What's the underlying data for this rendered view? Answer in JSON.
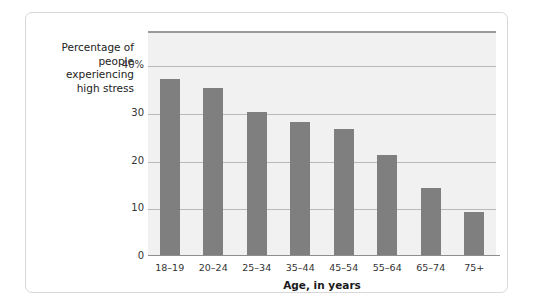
{
  "chart_data": {
    "type": "bar",
    "title": "",
    "subtitle": "",
    "categories": [
      "18–19",
      "20–24",
      "25–34",
      "35–44",
      "45–54",
      "55–64",
      "65–74",
      "75+"
    ],
    "values": [
      37,
      35,
      30,
      28,
      26.5,
      21,
      14,
      9
    ],
    "xlabel": "Age, in years",
    "ylabel": "Percentage of\npeople\nexperiencing\nhigh stress",
    "ylim": [
      0,
      47
    ],
    "yticks": [
      0,
      10,
      20,
      30,
      40
    ],
    "ytick_labels": [
      "0",
      "10",
      "20",
      "30",
      "40%"
    ],
    "grid": true,
    "legend": "none",
    "bar_color": "#7f7f7f",
    "plot_background": "#f1f1f1",
    "gridline_color": "#b9b9b9"
  }
}
